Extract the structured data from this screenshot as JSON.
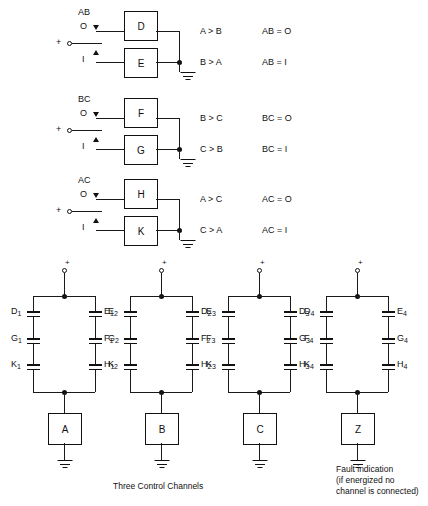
{
  "diagram": {
    "line_color": "#111111",
    "background": "#ffffff"
  },
  "comparators": [
    {
      "name": "AB",
      "pair_label": "AB",
      "pos_terminal": "+",
      "state_top": "O",
      "state_bottom": "I",
      "box_top": "D",
      "box_bottom": "E",
      "out_top": "A > B",
      "out_bottom": "B > A",
      "cond_top": "AB = O",
      "cond_bottom": "AB = I"
    },
    {
      "name": "BC",
      "pair_label": "BC",
      "pos_terminal": "+",
      "state_top": "O",
      "state_bottom": "I",
      "box_top": "F",
      "box_bottom": "G",
      "out_top": "B > C",
      "out_bottom": "C > B",
      "cond_top": "BC = O",
      "cond_bottom": "BC = I"
    },
    {
      "name": "AC",
      "pair_label": "AC",
      "pos_terminal": "+",
      "state_top": "O",
      "state_bottom": "I",
      "box_top": "H",
      "box_bottom": "K",
      "out_top": "A > C",
      "out_bottom": "C > A",
      "cond_top": "AC = O",
      "cond_bottom": "AC = I"
    }
  ],
  "ladders": [
    {
      "id": "channel-a",
      "supply": "+",
      "left_contacts": [
        "D",
        "G",
        "K"
      ],
      "left_subs": [
        "1",
        "1",
        "1"
      ],
      "right_contacts": [
        "E",
        "F",
        "H"
      ],
      "right_subs": [
        "1",
        "1",
        "1"
      ],
      "output_box": "A"
    },
    {
      "id": "channel-b",
      "supply": "+",
      "left_contacts": [
        "E",
        "G",
        "K"
      ],
      "left_subs": [
        "2",
        "2",
        "2"
      ],
      "right_contacts": [
        "D",
        "F",
        "H"
      ],
      "right_subs": [
        "2",
        "2",
        "2"
      ],
      "output_box": "B"
    },
    {
      "id": "channel-c",
      "supply": "+",
      "left_contacts": [
        "E",
        "F",
        "K"
      ],
      "left_subs": [
        "3",
        "3",
        "3"
      ],
      "right_contacts": [
        "D",
        "G",
        "H"
      ],
      "right_subs": [
        "3",
        "3",
        "3"
      ],
      "output_box": "C"
    },
    {
      "id": "channel-z",
      "supply": "+",
      "left_contacts": [
        "D",
        "F",
        "K"
      ],
      "left_subs": [
        "4",
        "4",
        "4"
      ],
      "right_contacts": [
        "E",
        "G",
        "H"
      ],
      "right_subs": [
        "4",
        "4",
        "4"
      ],
      "output_box": "Z"
    }
  ],
  "captions": {
    "left": "Three Control Channels",
    "right": "Fault indication\n(if energized no\nchannel is connected)"
  }
}
